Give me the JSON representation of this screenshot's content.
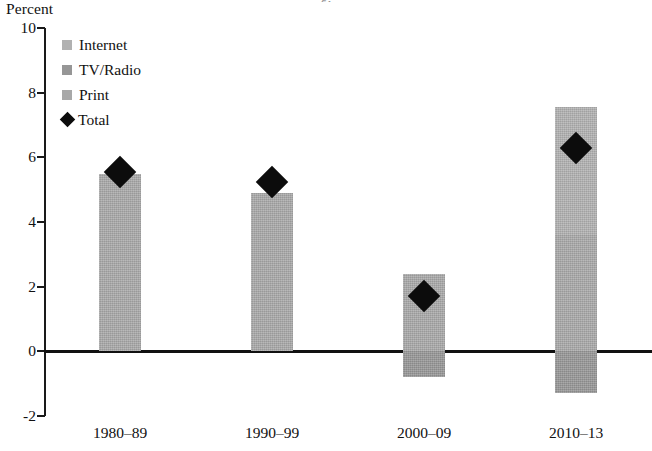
{
  "chart": {
    "title_fragment": "g,",
    "y_axis_title": "Percent"
  },
  "legend": {
    "items": [
      {
        "label": "Internet",
        "marker": "square-swatch-icon",
        "color": "#b1b1b1"
      },
      {
        "label": "TV/Radio",
        "marker": "square-swatch-icon",
        "color": "#969696"
      },
      {
        "label": "Print",
        "marker": "square-swatch-icon",
        "color": "#a8a8a8"
      },
      {
        "label": "Total",
        "marker": "diamond-marker-icon",
        "color": "#0c0c0c"
      }
    ]
  },
  "chart_data": {
    "type": "bar",
    "subtype": "stacked-bar-with-overlay-marker",
    "title": "",
    "xlabel": "",
    "ylabel": "Percent",
    "ylim": [
      -2,
      10
    ],
    "yticks": [
      -2,
      0,
      2,
      4,
      6,
      8,
      10
    ],
    "ytick_labels": [
      "-2",
      "0",
      "2",
      "4",
      "6",
      "8",
      "10"
    ],
    "grid": false,
    "legend_position": "top-left",
    "categories": [
      "1980–89",
      "1990–99",
      "2000–09",
      "2010–13"
    ],
    "series": [
      {
        "name": "Internet",
        "color": "#b1b1b1",
        "values": [
          0,
          0,
          0,
          3.95
        ]
      },
      {
        "name": "TV/Radio",
        "color": "#969696",
        "values": [
          0,
          0,
          -0.8,
          -1.3
        ]
      },
      {
        "name": "Print",
        "color": "#a8a8a8",
        "values": [
          5.5,
          4.9,
          2.4,
          3.6
        ]
      }
    ],
    "overlay": {
      "name": "Total",
      "type": "scatter",
      "marker": "diamond",
      "color": "#0c0c0c",
      "values": [
        5.55,
        5.25,
        1.7,
        6.3
      ]
    },
    "bar_segments": [
      {
        "category": "1980–89",
        "segments": [
          {
            "series": "Print",
            "from": 0,
            "to": 5.5
          }
        ],
        "total": 5.55
      },
      {
        "category": "1990–99",
        "segments": [
          {
            "series": "Print",
            "from": 0,
            "to": 4.9
          }
        ],
        "total": 5.25
      },
      {
        "category": "2000–09",
        "segments": [
          {
            "series": "Print",
            "from": 0,
            "to": 2.4
          },
          {
            "series": "TV/Radio",
            "from": -0.8,
            "to": 0
          }
        ],
        "total": 1.7
      },
      {
        "category": "2010–13",
        "segments": [
          {
            "series": "Internet",
            "from": 3.6,
            "to": 7.55
          },
          {
            "series": "Print",
            "from": 0,
            "to": 3.6
          },
          {
            "series": "TV/Radio",
            "from": -1.3,
            "to": 0
          }
        ],
        "total": 6.3
      }
    ]
  }
}
